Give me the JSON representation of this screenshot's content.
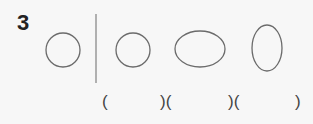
{
  "question": {
    "number": "3"
  },
  "shapes": [
    {
      "type": "circle",
      "label": "reference circle"
    },
    {
      "type": "circle",
      "label": "option 1 circle"
    },
    {
      "type": "ellipse-horizontal",
      "label": "option 2 wide ellipse"
    },
    {
      "type": "ellipse-vertical",
      "label": "option 3 tall ellipse"
    }
  ],
  "answers": {
    "open_1": "(",
    "close_open_1": ")(",
    "close_open_2": ")(",
    "close_3": ")"
  },
  "colors": {
    "stroke": "#6b6b6b",
    "divider": "#8a8a8a",
    "text": "#222222"
  }
}
